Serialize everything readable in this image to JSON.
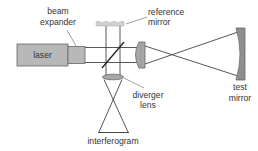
{
  "diagram": {
    "type": "optical-setup",
    "colors": {
      "component_fill": "#b8b8b8",
      "component_stroke": "#666666",
      "mirror_fill": "#8f8f8f",
      "reference_fill": "#d0d0d0",
      "ray_color": "#444444",
      "label_color": "#333333"
    },
    "components": {
      "laser": {
        "label": "laser"
      },
      "beam_expander": {
        "label_line1": "beam",
        "label_line2": "expander"
      },
      "reference_mirror": {
        "label_line1": "reference",
        "label_line2": "mirror"
      },
      "beam_splitter": {},
      "lens": {},
      "test_mirror": {
        "label_line1": "test",
        "label_line2": "mirror"
      },
      "diverger_lens": {
        "label_line1": "diverger",
        "label_line2": "lens"
      },
      "interferogram": {
        "label": "interferogram"
      }
    }
  }
}
